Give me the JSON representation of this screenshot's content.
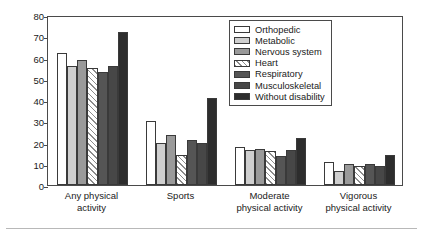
{
  "chart_data": {
    "type": "bar",
    "title": "",
    "xlabel": "",
    "ylabel": "Percent",
    "ylim": [
      0,
      80
    ],
    "yticks": [
      0,
      10,
      20,
      30,
      40,
      50,
      60,
      70,
      80
    ],
    "grid": false,
    "legend_position": "top-right",
    "categories": [
      "Any physical activity",
      "Sports",
      "Moderate physical activity",
      "Vigorous physical activity"
    ],
    "category_lines": [
      [
        "Any physical",
        "activity"
      ],
      [
        "Sports",
        ""
      ],
      [
        "Moderate",
        "physical activity"
      ],
      [
        "Vigorous",
        "physical activity"
      ]
    ],
    "series": [
      {
        "name": "Orthopedic",
        "fill": "white",
        "color": "#ffffff",
        "values": [
          62,
          30,
          18,
          11
        ]
      },
      {
        "name": "Metabolic",
        "fill": "light-gray",
        "color": "#cfcfcf",
        "values": [
          56,
          20,
          16.5,
          6.5
        ]
      },
      {
        "name": "Nervous system",
        "fill": "medium-gray",
        "color": "#9a9a9a",
        "values": [
          59,
          23.5,
          17,
          10
        ]
      },
      {
        "name": "Heart",
        "fill": "diagonal-hatch",
        "color": "#8c8c8c",
        "values": [
          55,
          14,
          16,
          9
        ]
      },
      {
        "name": "Respiratory",
        "fill": "dark-gray",
        "color": "#555555",
        "values": [
          53,
          21,
          13.5,
          10
        ]
      },
      {
        "name": "Musculoskeletal",
        "fill": "darker-gray",
        "color": "#474747",
        "values": [
          56,
          20,
          16.5,
          9
        ]
      },
      {
        "name": "Without disability",
        "fill": "near-black",
        "color": "#2d2d2d",
        "values": [
          72,
          41,
          22,
          14
        ]
      }
    ]
  }
}
